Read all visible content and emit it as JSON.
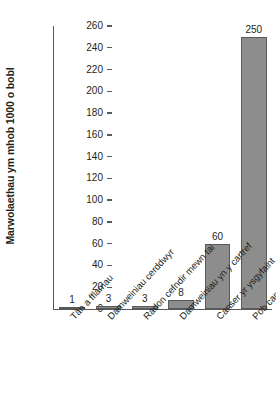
{
  "chart_data": {
    "type": "bar",
    "title": "",
    "xlabel": "",
    "ylabel": "Marwolaethau ym mhob 1000 o bobl",
    "ylim": [
      0,
      260
    ],
    "ytick_step": 20,
    "yticks": [
      0,
      20,
      40,
      60,
      80,
      100,
      120,
      140,
      160,
      180,
      200,
      220,
      240,
      260
    ],
    "ytick_labels": [
      "0",
      "20",
      "40",
      "60",
      "80",
      "100",
      "120",
      "140",
      "160",
      "180",
      "200",
      "220",
      "240",
      "260"
    ],
    "grid": false,
    "legend": null,
    "categories": [
      "Tân a fflamau",
      "Damweiniau cerddwyr",
      "Radon cefndir mewn tai",
      "Damweiniau yn y cartref",
      "Canser yr ysgyfaint",
      "Pob canser"
    ],
    "values": [
      1,
      3,
      3,
      8,
      60,
      250
    ],
    "value_labels": [
      "1",
      "3",
      "3",
      "8",
      "60",
      "250"
    ],
    "colors": {
      "bar_fill": "#8d8d8d",
      "bar_stroke": "#58595b",
      "axis": "#58595b",
      "text": "#231f20",
      "background": "#ffffff"
    }
  }
}
